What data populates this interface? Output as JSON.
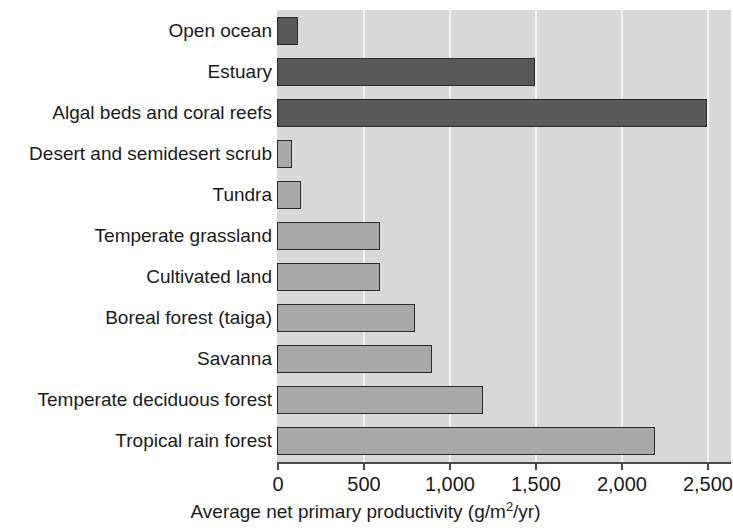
{
  "chart_data": {
    "type": "bar",
    "orientation": "horizontal",
    "title": "",
    "xlabel": "Average net primary productivity (g/m2/yr)",
    "xlabel_parts": {
      "before": "Average net primary productivity (g/m",
      "sup": "2",
      "after": "/yr)"
    },
    "ylabel": "",
    "xlim": [
      0,
      2640
    ],
    "xticks": [
      0,
      500,
      1000,
      1500,
      2000,
      2500
    ],
    "xtick_labels": [
      "0",
      "500",
      "1,000",
      "1,500",
      "2,000",
      "2,500"
    ],
    "grid": "vertical-white-gridlines",
    "legend": "none",
    "categories": [
      "Open ocean",
      "Estuary",
      "Algal beds and coral reefs",
      "Desert and semidesert scrub",
      "Tundra",
      "Temperate grassland",
      "Cultivated land",
      "Boreal forest (taiga)",
      "Savanna",
      "Temperate deciduous forest",
      "Tropical rain forest"
    ],
    "values": [
      125,
      1500,
      2500,
      90,
      140,
      600,
      600,
      800,
      900,
      1200,
      2200
    ],
    "bar_styles": [
      "dark",
      "dark",
      "dark",
      "mid",
      "mid",
      "mid",
      "mid",
      "mid",
      "mid",
      "mid",
      "mid"
    ],
    "colors": {
      "plot_background": "#d8d8d8",
      "gridline": "#f2f2f2",
      "bar_dark": "#595959",
      "bar_mid": "#a8a8a8",
      "bar_outline": "#2b2b2b",
      "axis": "#4a4a4a",
      "text": "#1a1a1a",
      "page_background": "#ffffff"
    }
  }
}
